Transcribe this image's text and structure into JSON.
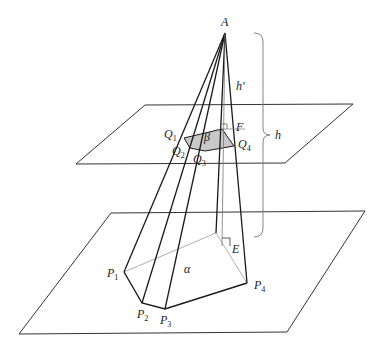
{
  "diagram": {
    "type": "geometry-pyramid-cross-section",
    "colors": {
      "line": "#1a1a1a",
      "plane": "#333333",
      "hidden": "#9a9a9a",
      "section_fill": "#c8c8c8",
      "brace": "#777777"
    },
    "labels": {
      "apex": "A",
      "foot_upper": "F",
      "foot_lower": "E",
      "height_small": "h'",
      "height_full": "h",
      "section_area": "β",
      "base_area": "α",
      "Q1": "Q",
      "Q1_sub": "1",
      "Q2": "Q",
      "Q2_sub": "2",
      "Q3": "Q",
      "Q3_sub": "3",
      "Q4": "Q",
      "Q4_sub": "4",
      "P1": "P",
      "P1_sub": "1",
      "P2": "P",
      "P2_sub": "2",
      "P3": "P",
      "P3_sub": "3",
      "P4": "P",
      "P4_sub": "4"
    },
    "points": {
      "A": [
        225,
        33
      ],
      "F": [
        222,
        129
      ],
      "E": [
        222,
        246
      ],
      "Q": [
        [
          184,
          138
        ],
        [
          190,
          148
        ],
        [
          205,
          151
        ],
        [
          234,
          146
        ],
        [
          222,
          129
        ]
      ],
      "P": [
        [
          124,
          272
        ],
        [
          142,
          303
        ],
        [
          165,
          309
        ],
        [
          247,
          283
        ],
        [
          216,
          233
        ]
      ],
      "upper_plane": [
        [
          145,
          105
        ],
        [
          353,
          104
        ],
        [
          285,
          163
        ],
        [
          76,
          164
        ]
      ],
      "lower_plane": [
        [
          111,
          213
        ],
        [
          365,
          211
        ],
        [
          287,
          332
        ],
        [
          19,
          334
        ]
      ]
    }
  }
}
